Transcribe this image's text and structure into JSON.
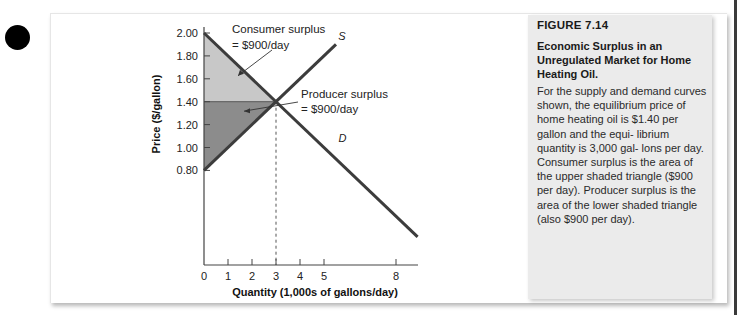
{
  "figure": {
    "number": "FIGURE 7.14",
    "title": "Economic Surplus in an Unregulated Market for Home Heating Oil.",
    "body": "For the supply and demand curves shown, the equilibrium price of home heating oil is $1.40 per gallon and the equi- librium quantity is 3,000 gal- lons per day. Consumer surplus is the area of the upper shaded triangle ($900 per day). Producer surplus is the area of the lower shaded triangle (also $900 per day)."
  },
  "chart_data": {
    "type": "line",
    "title": "",
    "xlabel": "Quantity (1,000s of gallons/day)",
    "ylabel": "Price ($/gallon)",
    "xlim": [
      0,
      9
    ],
    "ylim": [
      0.8,
      2.0
    ],
    "x_ticks": [
      0,
      1,
      2,
      3,
      4,
      5,
      8
    ],
    "x_tick_labels": [
      "0",
      "1",
      "2",
      "3",
      "4",
      "5",
      "8"
    ],
    "y_ticks": [
      0.8,
      1.0,
      1.2,
      1.4,
      1.6,
      1.8,
      2.0
    ],
    "y_tick_labels": [
      "0.80",
      "1.00",
      "1.20",
      "1.40",
      "1.60",
      "1.80",
      "2.00"
    ],
    "grid": false,
    "series": [
      {
        "name": "S",
        "label": "S",
        "points": [
          [
            0,
            0.8
          ],
          [
            5.5,
            1.9
          ]
        ]
      },
      {
        "name": "D",
        "label": "D",
        "points": [
          [
            0,
            2.0
          ],
          [
            8.9,
            0.22
          ]
        ]
      }
    ],
    "equilibrium": {
      "quantity": 3,
      "price": 1.4
    },
    "shaded_regions": [
      {
        "name": "consumer-surplus",
        "points": [
          [
            0,
            2.0
          ],
          [
            0,
            1.4
          ],
          [
            3,
            1.4
          ]
        ],
        "color": "#c8c8c8"
      },
      {
        "name": "producer-surplus",
        "points": [
          [
            0,
            1.4
          ],
          [
            0,
            0.8
          ],
          [
            3,
            1.4
          ]
        ],
        "color": "#8c8c8c"
      }
    ],
    "annotations": [
      {
        "name": "consumer-surplus-label",
        "lines": [
          "Consumer surplus",
          "= $900/day"
        ],
        "arrow_to": [
          1.0,
          1.6
        ]
      },
      {
        "name": "producer-surplus-label",
        "lines": [
          "Producer surplus",
          "= $900/day"
        ],
        "arrow_to": [
          1.0,
          1.3
        ]
      }
    ],
    "colors": {
      "curve": "#3c3c3c",
      "axis": "#444444"
    }
  }
}
